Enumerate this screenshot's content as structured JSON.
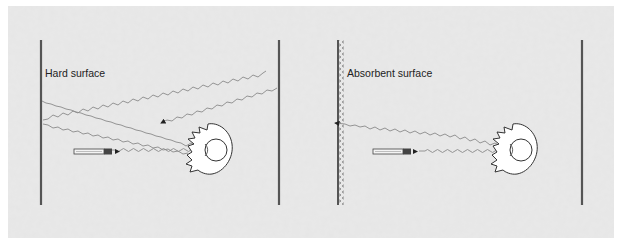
{
  "background": {
    "panel_color": "#e6e6e6",
    "noise_color": "#d2d2d2",
    "page_color": "#ffffff"
  },
  "colors": {
    "wall": "#555555",
    "wave": "#8a8a8a",
    "outline": "#333333",
    "arrow": "#222222"
  },
  "panels": [
    {
      "id": "hard",
      "label": "Hard surface",
      "surface_type": "hard",
      "description_paths": [
        "person-to-mic direct",
        "person-to-left-wall reflected",
        "left-wall-to-right-wall reflected",
        "right-wall-to-room reflected"
      ]
    },
    {
      "id": "absorbent",
      "label": "Absorbent surface",
      "surface_type": "absorbent",
      "description_paths": [
        "person-to-mic direct",
        "person-to-absorbent-wall absorbed"
      ]
    }
  ]
}
